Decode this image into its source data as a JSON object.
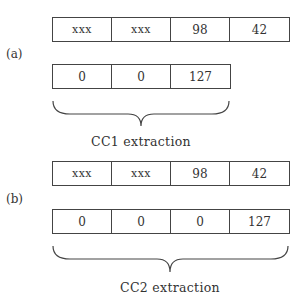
{
  "panels": [
    {
      "label": "(a)",
      "input_row": [
        "xxx",
        "xxx",
        "98",
        "42"
      ],
      "output_row": [
        "0",
        "0",
        "127"
      ],
      "caption": "CC1 extraction"
    },
    {
      "label": "(b)",
      "input_row": [
        "xxx",
        "xxx",
        "98",
        "42"
      ],
      "output_row": [
        "0",
        "0",
        "0",
        "127"
      ],
      "caption": "CC2 extraction"
    }
  ]
}
